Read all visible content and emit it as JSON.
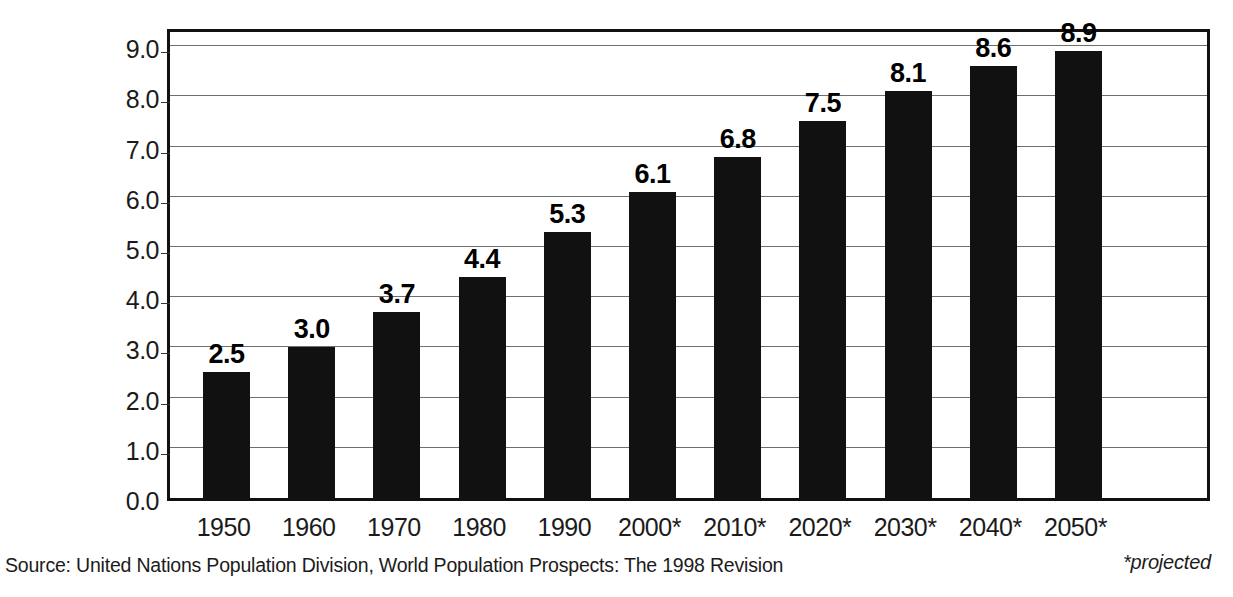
{
  "chart_data": {
    "type": "bar",
    "title": "",
    "subtitle": "",
    "xlabel": "",
    "ylabel": "",
    "categories": [
      "1950",
      "1960",
      "1970",
      "1980",
      "1990",
      "2000*",
      "2010*",
      "2020*",
      "2030*",
      "2040*",
      "2050*"
    ],
    "values": [
      2.5,
      3.0,
      3.7,
      4.4,
      5.3,
      6.1,
      6.8,
      7.5,
      8.1,
      8.6,
      8.9
    ],
    "data_labels": [
      "2.5",
      "3.0",
      "3.7",
      "4.4",
      "5.3",
      "6.1",
      "6.8",
      "7.5",
      "8.1",
      "8.6",
      "8.9"
    ],
    "ylim": [
      0.0,
      9.4
    ],
    "y_ticks": [
      0.0,
      1.0,
      2.0,
      3.0,
      4.0,
      5.0,
      6.0,
      7.0,
      8.0,
      9.0
    ],
    "y_tick_labels": [
      "0.0",
      "1.0",
      "2.0",
      "3.0",
      "4.0",
      "5.0",
      "6.0",
      "7.0",
      "8.0",
      "9.0"
    ],
    "grid": true,
    "legend": false,
    "bar_color": "#111111",
    "grid_color": "#6f6f6f",
    "frame_color": "#111111"
  },
  "notes": {
    "source": "Source: United Nations Population Division, World Population Prospects: The 1998 Revision",
    "projected": "*projected"
  }
}
